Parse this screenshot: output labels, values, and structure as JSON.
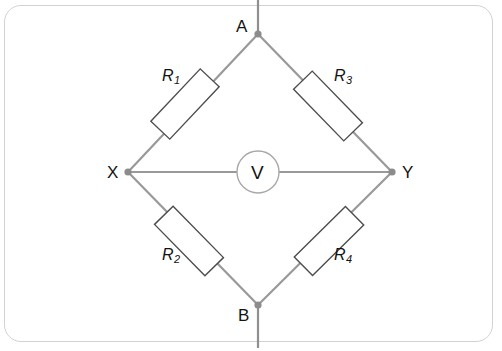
{
  "figure": {
    "background_color": "#ffffff",
    "frame_color": "#d2d2d2",
    "wire_color": "#999999",
    "node_color": "#8c8c8c",
    "component_outline_color": "#4d4d4d",
    "component_fill_color": "#ffffff",
    "text_color": "#131313"
  },
  "nodes": [
    {
      "id": "A",
      "label": "A",
      "x": 258,
      "y": 34,
      "label_x": 236,
      "label_y": 18
    },
    {
      "id": "X",
      "label": "X",
      "x": 128,
      "y": 172,
      "label_x": 107,
      "label_y": 164
    },
    {
      "id": "Y",
      "label": "Y",
      "x": 392,
      "y": 172,
      "label_x": 402,
      "label_y": 164
    },
    {
      "id": "B",
      "label": "B",
      "x": 258,
      "y": 305,
      "label_x": 238,
      "label_y": 307
    }
  ],
  "resistors": [
    {
      "id": "R1",
      "letter": "R",
      "subscript": "1",
      "between": [
        "X",
        "A"
      ],
      "label_x": 162,
      "label_y": 68
    },
    {
      "id": "R3",
      "letter": "R",
      "subscript": "3",
      "between": [
        "A",
        "Y"
      ],
      "label_x": 334,
      "label_y": 68
    },
    {
      "id": "R2",
      "letter": "R",
      "subscript": "2",
      "between": [
        "X",
        "B"
      ],
      "label_x": 162,
      "label_y": 247
    },
    {
      "id": "R4",
      "letter": "R",
      "subscript": "4",
      "between": [
        "B",
        "Y"
      ],
      "label_x": 334,
      "label_y": 247
    }
  ],
  "meter": {
    "id": "voltmeter",
    "label": "V",
    "cx": 258,
    "cy": 172,
    "r": 21,
    "between": [
      "X",
      "Y"
    ]
  },
  "terminals": [
    {
      "id": "terminal-top",
      "from_node": "A",
      "direction": "up",
      "end_y": 0
    },
    {
      "id": "terminal-bottom",
      "from_node": "B",
      "direction": "down",
      "end_y": 348
    }
  ]
}
